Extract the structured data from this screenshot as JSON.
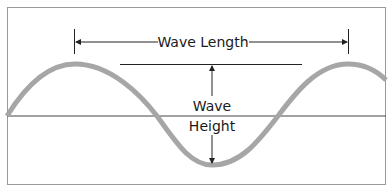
{
  "diagram": {
    "type": "wave-anatomy",
    "labels": {
      "wave_length": "Wave Length",
      "wave_height_line1": "Wave",
      "wave_height_line2": "Height"
    },
    "colors": {
      "wave": "#a6a6a6",
      "frame": "#9a9a9a",
      "lines": "#222222",
      "baseline": "#444444",
      "background": "#ffffff"
    }
  }
}
